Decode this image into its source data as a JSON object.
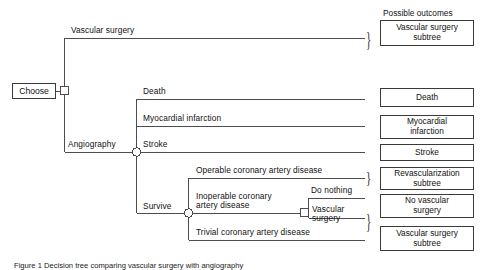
{
  "figure": {
    "caption": "Figure 1  Decision tree comparing vascular surgery with angiography"
  },
  "outcomes_header": "Possible outcomes",
  "root": {
    "node_label": "Choose",
    "node_type": "decision-square"
  },
  "branches": {
    "vascular_surgery": "Vascular surgery",
    "angiography": "Angiography",
    "death": "Death",
    "myocardial_infarction": "Myocardial infarction",
    "stroke": "Stroke",
    "survive": "Survive",
    "operable": "Operable coronary artery disease",
    "inoperable_line1": "Inoperable coronary",
    "inoperable_line2": "artery disease",
    "trivial": "Trivial coronary artery disease",
    "do_nothing": "Do nothing",
    "vascular_surgery_sub_line1": "Vascular",
    "vascular_surgery_sub_line2": "surgery"
  },
  "outcomes": [
    {
      "id": "vascular-surgery-subtree-top",
      "text": "Vascular  surgery\nsubtree",
      "braced": true
    },
    {
      "id": "death",
      "text": "Death",
      "braced": false
    },
    {
      "id": "myocardial-infarction",
      "text": "Myocardial\ninfarction",
      "braced": false
    },
    {
      "id": "stroke",
      "text": "Stroke",
      "braced": false
    },
    {
      "id": "revascularization-subtree",
      "text": "Revascularization\nsubtree",
      "braced": true
    },
    {
      "id": "no-vascular-surgery",
      "text": "No vascular\nsurgery",
      "braced": false
    },
    {
      "id": "vascular-surgery-subtree-bottom",
      "text": "Vascular surgery\nsubtree",
      "braced": true
    }
  ],
  "colors": {
    "line": "#3a3a3a",
    "text": "#111111",
    "background": "#ffffff"
  }
}
